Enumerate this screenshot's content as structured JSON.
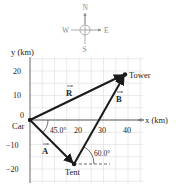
{
  "compass": {
    "north": "N",
    "south": "S",
    "east": "E",
    "west": "W"
  },
  "axes": {
    "y_label": "y (km)",
    "x_label": "x (km)",
    "y_ticks": [
      "20",
      "10",
      "0",
      "−10",
      "−20"
    ],
    "x_ticks": [
      "20",
      "30",
      "40"
    ]
  },
  "points": {
    "car": "Car",
    "tent": "Tent",
    "tower": "Tower"
  },
  "vectors": {
    "A": "A",
    "B": "B",
    "R": "R"
  },
  "angles": {
    "angle_A": "45.0°",
    "angle_B": "60.0°"
  },
  "colors": {
    "grid": "#d8d8d8",
    "axis": "#555555",
    "vector": "#1a1a1a",
    "compass": "#9a9a9a"
  }
}
